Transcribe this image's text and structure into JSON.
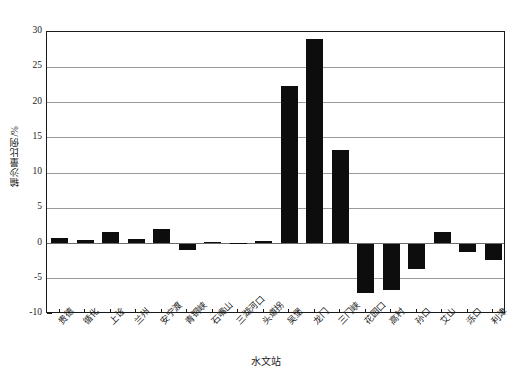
{
  "chart_data": {
    "type": "bar",
    "title": "",
    "xlabel": "水文站",
    "ylabel": "输沙量比例/%",
    "ylim": [
      -10,
      30
    ],
    "yticks": [
      -10,
      -5,
      0,
      5,
      10,
      15,
      20,
      25,
      30
    ],
    "ytick_labels": [
      "-10",
      "-5",
      "0",
      "5",
      "10",
      "15",
      "20",
      "25",
      "30"
    ],
    "minor_tick_step": 1,
    "grid": true,
    "grid_axis": "y",
    "legend": "none",
    "bar_color": "#0d0d0d",
    "categories": [
      "贵德",
      "循化",
      "上诠",
      "兰州",
      "安宁渡",
      "青铜峡",
      "石嘴山",
      "三湖河口",
      "头道拐",
      "吴堡",
      "龙门",
      "三门峡",
      "花园口",
      "高村",
      "孙口",
      "艾山",
      "泺口",
      "利津"
    ],
    "values": [
      0.8,
      0.5,
      1.7,
      0.6,
      2.1,
      -0.9,
      0.2,
      0.1,
      0.3,
      22.4,
      29.0,
      13.3,
      -7.0,
      -6.6,
      -3.6,
      1.6,
      -1.2,
      -2.3
    ]
  },
  "caption": {
    "text": ""
  }
}
